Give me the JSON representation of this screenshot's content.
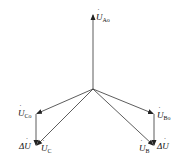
{
  "diagram": {
    "type": "phasor-diagram",
    "origin": [
      93,
      89
    ],
    "vectors": [
      {
        "id": "U_Ao",
        "main": "U",
        "sub": "Ao",
        "from": [
          93,
          89
        ],
        "to": [
          93,
          14
        ]
      },
      {
        "id": "U_Co",
        "main": "U",
        "sub": "Co",
        "from": [
          93,
          89
        ],
        "to": [
          36,
          114
        ]
      },
      {
        "id": "U_C",
        "main": "U",
        "sub": "C",
        "from": [
          93,
          89
        ],
        "to": [
          36,
          146
        ]
      },
      {
        "id": "U_Bo",
        "main": "U",
        "sub": "Bo",
        "from": [
          93,
          89
        ],
        "to": [
          154,
          114
        ]
      },
      {
        "id": "U_B",
        "main": "U",
        "sub": "B",
        "from": [
          93,
          89
        ],
        "to": [
          154,
          146
        ]
      },
      {
        "id": "dU_left",
        "main": "ΔU",
        "from": [
          36,
          114
        ],
        "to": [
          36,
          146
        ]
      },
      {
        "id": "dU_right",
        "main": "ΔU",
        "from": [
          154,
          114
        ],
        "to": [
          154,
          146
        ]
      }
    ],
    "labels": {
      "ao": {
        "main": "U",
        "sub": "Ao"
      },
      "co": {
        "main": "U",
        "sub": "Co"
      },
      "c": {
        "main": "U",
        "sub": "C"
      },
      "bo": {
        "main": "U",
        "sub": "Bo"
      },
      "b": {
        "main": "U",
        "sub": "B"
      },
      "du_left": "ΔU",
      "du_right": "ΔU",
      "dot": "·"
    },
    "colors": {
      "line": "#333333",
      "text": "#111111"
    }
  }
}
